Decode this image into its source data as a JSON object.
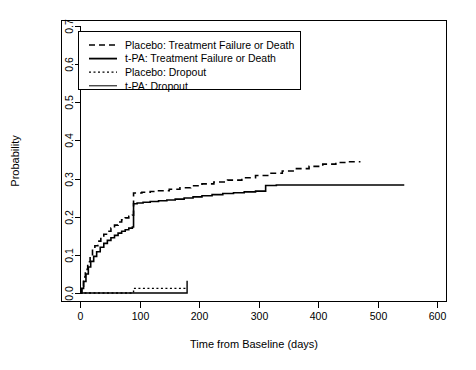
{
  "chart_data": {
    "type": "line",
    "title": "",
    "subtitle": "",
    "xlabel": "Time from Baseline (days)",
    "ylabel": "Probability",
    "xlim": [
      -30,
      625
    ],
    "ylim": [
      -0.012,
      0.715
    ],
    "xticks": [
      0,
      100,
      200,
      300,
      400,
      500,
      600
    ],
    "xtick_labels": [
      "0",
      "100",
      "200",
      "300",
      "400",
      "500",
      "600"
    ],
    "yticks": [
      0.0,
      0.1,
      0.2,
      0.3,
      0.4,
      0.5,
      0.6,
      0.7
    ],
    "ytick_labels": [
      "0.0",
      "0.1",
      "0.2",
      "0.3",
      "0.4",
      "0.5",
      "0.6",
      "0.7"
    ],
    "grid": false,
    "legend_position": "top-left",
    "frame": true,
    "step_type": "post",
    "series": [
      {
        "name": "Placebo: Treatment Failure or Death",
        "key": "placebo_failure",
        "style": "dashed",
        "color": "#000000",
        "width": 1.6,
        "dash": "6,4",
        "x": [
          0,
          3,
          6,
          9,
          13,
          17,
          21,
          25,
          30,
          35,
          40,
          46,
          52,
          58,
          64,
          70,
          76,
          82,
          88,
          90,
          90,
          104,
          118,
          132,
          150,
          168,
          186,
          205,
          225,
          248,
          272,
          295,
          318,
          340,
          362,
          385,
          408,
          430,
          450,
          470
        ],
        "y": [
          0.0,
          0.018,
          0.042,
          0.062,
          0.082,
          0.098,
          0.112,
          0.124,
          0.136,
          0.146,
          0.154,
          0.162,
          0.17,
          0.178,
          0.186,
          0.192,
          0.197,
          0.201,
          0.204,
          0.206,
          0.262,
          0.264,
          0.266,
          0.268,
          0.272,
          0.276,
          0.281,
          0.286,
          0.291,
          0.296,
          0.302,
          0.308,
          0.314,
          0.32,
          0.326,
          0.332,
          0.338,
          0.342,
          0.344,
          0.346
        ]
      },
      {
        "name": "t-PA: Treatment Failure or Death",
        "key": "tpa_failure",
        "style": "solid",
        "color": "#000000",
        "width": 1.6,
        "dash": "",
        "x": [
          0,
          3,
          6,
          10,
          14,
          18,
          23,
          28,
          34,
          40,
          46,
          52,
          58,
          64,
          70,
          76,
          82,
          88,
          90,
          90,
          96,
          106,
          118,
          132,
          146,
          160,
          175,
          190,
          205,
          222,
          240,
          258,
          276,
          295,
          312,
          312,
          330,
          350,
          372,
          395,
          420,
          445,
          470,
          495,
          520,
          545
        ],
        "y": [
          0.0,
          0.012,
          0.03,
          0.05,
          0.068,
          0.083,
          0.096,
          0.108,
          0.12,
          0.13,
          0.138,
          0.145,
          0.151,
          0.157,
          0.162,
          0.166,
          0.17,
          0.173,
          0.175,
          0.234,
          0.236,
          0.238,
          0.24,
          0.242,
          0.244,
          0.246,
          0.249,
          0.252,
          0.255,
          0.258,
          0.261,
          0.263,
          0.265,
          0.267,
          0.268,
          0.282,
          0.283,
          0.283,
          0.283,
          0.283,
          0.283,
          0.283,
          0.283,
          0.283,
          0.283,
          0.283
        ]
      },
      {
        "name": "Placebo: Dropout",
        "key": "placebo_dropout",
        "style": "dotted",
        "color": "#000000",
        "width": 1.4,
        "dash": "2,2.5",
        "x": [
          0,
          88,
          90,
          120,
          150,
          178
        ],
        "y": [
          0.0,
          0.0,
          0.012,
          0.012,
          0.012,
          0.012
        ]
      },
      {
        "name": "t-PA: Dropout",
        "key": "tpa_dropout",
        "style": "solid",
        "color": "#000000",
        "width": 1.4,
        "dash": "",
        "x": [
          0,
          60,
          120,
          178,
          180,
          180
        ],
        "y": [
          0.0,
          0.0,
          0.0,
          0.0,
          0.0,
          0.032
        ]
      }
    ],
    "legend_entries": [
      {
        "label": "Placebo: Treatment Failure or Death",
        "style": "dashed",
        "dash": "6,4",
        "width": 1.6
      },
      {
        "label": "t-PA: Treatment Failure or Death",
        "style": "solid",
        "dash": "",
        "width": 1.8
      },
      {
        "label": "Placebo: Dropout",
        "style": "dotted",
        "dash": "2,2.5",
        "width": 1.2
      },
      {
        "label": "t-PA: Dropout",
        "style": "solid",
        "dash": "",
        "width": 1.0
      }
    ]
  },
  "figure": {
    "background": "#ffffff",
    "foreground": "#000000",
    "plot_left_px": 80,
    "plot_right_px": 447,
    "plot_top_px": 20,
    "plot_bottom_px": 301
  }
}
